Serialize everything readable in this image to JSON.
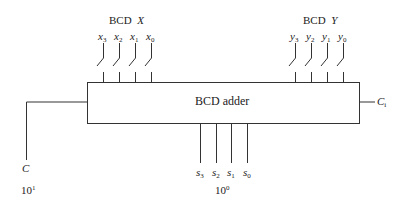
{
  "diagram": {
    "block": {
      "label": "BCD adder"
    },
    "input_x": {
      "title": "BCD",
      "var": "X",
      "bits": [
        {
          "name": "x",
          "sub": "3"
        },
        {
          "name": "x",
          "sub": "2"
        },
        {
          "name": "x",
          "sub": "1"
        },
        {
          "name": "x",
          "sub": "0"
        }
      ]
    },
    "input_y": {
      "title": "BCD",
      "var": "Y",
      "bits": [
        {
          "name": "y",
          "sub": "3"
        },
        {
          "name": "y",
          "sub": "2"
        },
        {
          "name": "y",
          "sub": "1"
        },
        {
          "name": "y",
          "sub": "0"
        }
      ]
    },
    "outputs_s": {
      "bits": [
        {
          "name": "s",
          "sub": "3"
        },
        {
          "name": "s",
          "sub": "2"
        },
        {
          "name": "s",
          "sub": "1"
        },
        {
          "name": "s",
          "sub": "0"
        }
      ],
      "weight_base": "10",
      "weight_exp": "0"
    },
    "carry_out": {
      "name": "C",
      "weight_base": "10",
      "weight_exp": "1"
    },
    "carry_in": {
      "name": "C",
      "sub": "i"
    },
    "colors": {
      "line": "#333333",
      "background": "#ffffff"
    }
  }
}
